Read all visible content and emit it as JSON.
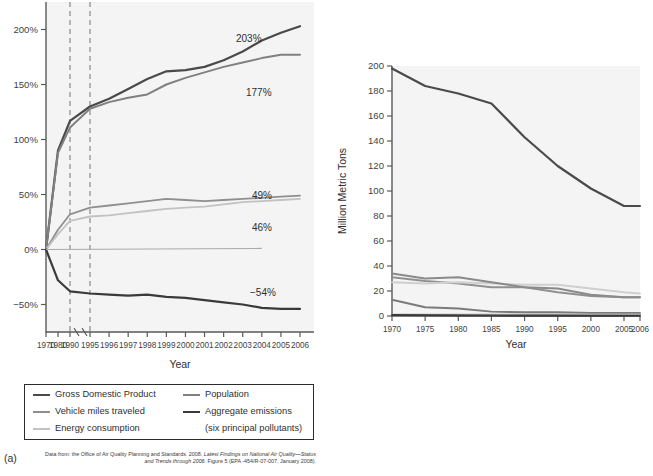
{
  "figure": {
    "panel_a_tag": "(a)",
    "panel_b_tag": "(b)"
  },
  "panel_a": {
    "xlabel": "Year",
    "ylabel": "",
    "ytick_labels": [
      "200%",
      "150%",
      "100%",
      "50%",
      "0%",
      "-50%"
    ],
    "xtick_labels": [
      "1970",
      "1980",
      "1990",
      "1995",
      "1996",
      "1997",
      "1998",
      "1999",
      "2000",
      "2001",
      "2002",
      "2003",
      "2004",
      "2005",
      "2006"
    ],
    "annotations": [
      "203%",
      "177%",
      "49%",
      "46%",
      "-54%"
    ],
    "legend": [
      {
        "label": "Gross Domestic Product",
        "color": "#4a4a4a"
      },
      {
        "label": "Population",
        "color": "#808080"
      },
      {
        "label": "Vehicle miles traveled",
        "color": "#8f8f8f"
      },
      {
        "label": "Aggregate emissions",
        "color": "#3a3a3a"
      },
      {
        "label": "Energy consumption",
        "color": "#c2c2c2"
      },
      {
        "label": "(six principal pollutants)",
        "color": ""
      }
    ],
    "credit_lead": "Data from: the Office of Air Quality Planning and Standards. 2008. ",
    "credit_italic": "Latest Findings on National Air Quality—Status and Trends through 2006.",
    "credit_tail": " Figure 5 (EPA -454/R-07-007, January 2008)."
  },
  "panel_b": {
    "xlabel": "Year",
    "ylabel": "Million Metric Tons",
    "ytick_labels": [
      "200",
      "180",
      "160",
      "140",
      "120",
      "100",
      "80",
      "60",
      "40",
      "20",
      "0"
    ],
    "xtick_labels": [
      "1970",
      "1975",
      "1980",
      "1985",
      "1990",
      "1995",
      "2000",
      "2005",
      "2006"
    ],
    "legend": [
      {
        "label": "Carbon monoxide (CO)",
        "color": "#4a4a4a"
      },
      {
        "label": "Sulfur dioxide (SO₂)",
        "color": "#909090"
      },
      {
        "label": "Nitrogen oxides (NOx)",
        "color": "#cfcfcf"
      },
      {
        "label": "Volatile organic compounds (VOC)",
        "color": "#8a8a8a"
      },
      {
        "label": "Particulate matter (PM)",
        "color": ""
      },
      {
        "label": "PM10",
        "color": "#7a7a7a"
      },
      {
        "label": "PM2.5",
        "color": "#9a9a9a"
      },
      {
        "label": "Lead",
        "color": "#3a3a3a"
      }
    ],
    "credit_lead": "Data from: the Office of Air Quality Planning and Standards. 2008. ",
    "credit_italic": "Latest Findings on National Air Quality—Status and Trends through 2006.",
    "credit_tail": " Figure 5 (EPA -454/R-07-007, January 2008)."
  },
  "chart_data": [
    {
      "type": "line",
      "panel": "a",
      "title": "",
      "xlabel": "Year",
      "ylabel": "Percent change from 1970",
      "x": [
        1970,
        1980,
        1990,
        1995,
        1996,
        1997,
        1998,
        1999,
        2000,
        2001,
        2002,
        2003,
        2004,
        2005,
        2006
      ],
      "ylim": [
        -75,
        225
      ],
      "xaxis_break_between": [
        1990,
        1995
      ],
      "grid": false,
      "legend_position": "below",
      "series": [
        {
          "name": "Gross Domestic Product",
          "color": "#4a4a4a",
          "values": [
            0,
            90,
            117,
            130,
            137,
            146,
            155,
            162,
            163,
            166,
            172,
            180,
            190,
            197,
            203
          ],
          "end_label": "203%"
        },
        {
          "name": "Population",
          "color": "#808080",
          "values": [
            0,
            88,
            111,
            128,
            134,
            138,
            141,
            150,
            156,
            161,
            166,
            170,
            174,
            177,
            177
          ],
          "end_label": "177%"
        },
        {
          "name": "Vehicle miles traveled",
          "color": "#8f8f8f",
          "values": [
            0,
            18,
            32,
            38,
            40,
            42,
            44,
            46,
            45,
            44,
            45,
            46,
            47,
            48,
            49
          ],
          "end_label": "49%"
        },
        {
          "name": "Energy consumption",
          "color": "#c2c2c2",
          "values": [
            0,
            14,
            26,
            30,
            31,
            33,
            35,
            37,
            38,
            39,
            41,
            43,
            44,
            45,
            46
          ],
          "end_label": "46%"
        },
        {
          "name": "Aggregate emissions (six principal pollutants)",
          "color": "#3a3a3a",
          "values": [
            0,
            -28,
            -38,
            -40,
            -41,
            -42,
            -41,
            -43,
            -44,
            -46,
            -48,
            -50,
            -53,
            -54,
            -54
          ],
          "end_label": "-54%"
        }
      ]
    },
    {
      "type": "line",
      "panel": "b",
      "title": "",
      "xlabel": "Year",
      "ylabel": "Million Metric Tons",
      "x": [
        1970,
        1975,
        1980,
        1985,
        1990,
        1995,
        2000,
        2005,
        2006
      ],
      "ylim": [
        0,
        200
      ],
      "grid": false,
      "legend_position": "below",
      "series": [
        {
          "name": "Carbon monoxide (CO)",
          "color": "#4a4a4a",
          "values": [
            198,
            184,
            178,
            170,
            143,
            120,
            102,
            88,
            88
          ]
        },
        {
          "name": "Sulfur dioxide (SO2)",
          "color": "#909090",
          "values": [
            31,
            28,
            26,
            23,
            23,
            19,
            16,
            15,
            15
          ]
        },
        {
          "name": "Nitrogen oxides (NOx)",
          "color": "#cfcfcf",
          "values": [
            27,
            26,
            27,
            26,
            25,
            25,
            22,
            19,
            18
          ]
        },
        {
          "name": "Volatile organic compounds (VOC)",
          "color": "#8a8a8a",
          "values": [
            34,
            30,
            31,
            27,
            23,
            22,
            17,
            15,
            15
          ]
        },
        {
          "name": "PM10",
          "color": "#7a7a7a",
          "values": [
            13,
            7,
            6,
            3.5,
            3,
            3,
            2.5,
            2.5,
            2.5
          ]
        },
        {
          "name": "PM2.5",
          "color": "#9a9a9a",
          "values": [
            1,
            1,
            1,
            1,
            1,
            1,
            1,
            1,
            1
          ]
        },
        {
          "name": "Lead",
          "color": "#3a3a3a",
          "values": [
            0.8,
            0.6,
            0.4,
            0.3,
            0.2,
            0.15,
            0.1,
            0.1,
            0.1
          ]
        }
      ]
    }
  ]
}
